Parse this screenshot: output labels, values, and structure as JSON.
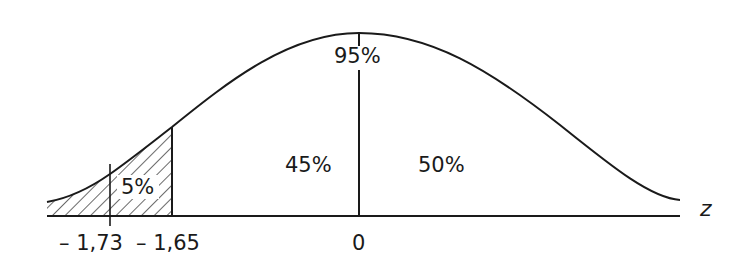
{
  "diagram": {
    "type": "normal-distribution-curve",
    "axis_label": "z",
    "regions": {
      "total_label": "95%",
      "middle_label": "45%",
      "right_label": "50%",
      "tail_label": "5%"
    },
    "ticks": {
      "t1": "– 1,73",
      "t2": "– 1,65",
      "t3": "0"
    },
    "colors": {
      "line": "#1a1a1a",
      "background": "#ffffff"
    }
  }
}
